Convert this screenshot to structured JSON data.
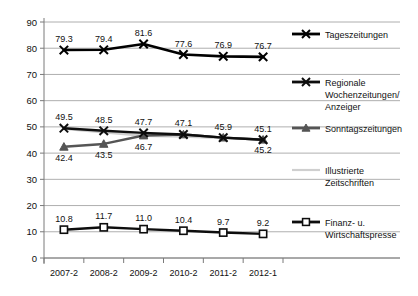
{
  "chart_data": {
    "type": "line",
    "title": "",
    "subtitle": "",
    "xlabel": "",
    "ylabel": "",
    "ylim": [
      0,
      90
    ],
    "ytick_step": 10,
    "yticks": [
      "0",
      "10",
      "20",
      "30",
      "40",
      "50",
      "60",
      "70",
      "80",
      "90"
    ],
    "grid": true,
    "legend_position": "right",
    "categories": [
      "2007-2",
      "2008-2",
      "2009-2",
      "2010-2",
      "2011-2",
      "2012-1"
    ],
    "series": [
      {
        "name": "Tageszeitungen",
        "color": "#000000",
        "marker": "x",
        "values": [
          79.3,
          79.4,
          81.6,
          77.6,
          76.9,
          76.7
        ],
        "labels": [
          "79.3",
          "79.4",
          "81.6",
          "77.6",
          "76.9",
          "76.7"
        ],
        "label_position": "above"
      },
      {
        "name": "Regionale Wochenzeitungen/ Anzeiger",
        "color": "#0d0d0d",
        "marker": "x",
        "values": [
          49.5,
          48.5,
          47.7,
          47.1,
          45.9,
          45.1
        ],
        "labels": [
          "49.5",
          "48.5",
          "47.7",
          "47.1",
          "45.9",
          "45.1"
        ],
        "label_position": "above"
      },
      {
        "name": "Sonntagszeitungen",
        "color": "#555555",
        "marker": "triangle",
        "values": [
          42.4,
          43.5,
          46.7,
          47.1,
          45.9,
          45.1
        ],
        "labels": [
          "42.4",
          "43.5",
          "46.7",
          "",
          "",
          ""
        ],
        "label_position": "below"
      },
      {
        "name": "Illustrierte Zeitschriften",
        "color": "#cfcfcf",
        "marker": "none",
        "values": [
          49.3,
          48.0,
          46.6,
          46.4,
          45.8,
          45.2
        ],
        "labels": [
          "",
          "",
          "",
          "",
          "",
          "45.2"
        ],
        "label_position": "below"
      },
      {
        "name": "Finanz- u. Wirtschaftspresse",
        "color": "#0d0d0d",
        "marker": "square",
        "values": [
          10.8,
          11.7,
          11.0,
          10.4,
          9.7,
          9.2
        ],
        "labels": [
          "10.8",
          "11.7",
          "11.0",
          "10.4",
          "9.7",
          "9.2"
        ],
        "label_position": "above"
      }
    ],
    "legend": [
      {
        "label": "Tageszeitungen",
        "lines": [
          "Tageszeitungen"
        ],
        "color": "#000000",
        "marker": "x"
      },
      {
        "label": "Regionale Wochenzeitungen/ Anzeiger",
        "lines": [
          "Regionale",
          "Wochenzeitungen/",
          "Anzeiger"
        ],
        "color": "#0d0d0d",
        "marker": "x"
      },
      {
        "label": "Sonntagszeitungen",
        "lines": [
          "Sonntagszeitungen"
        ],
        "color": "#555555",
        "marker": "triangle"
      },
      {
        "label": "Illustrierte Zeitschriften",
        "lines": [
          "Illustrierte",
          "Zeitschriften"
        ],
        "color": "#cfcfcf",
        "marker": "none"
      },
      {
        "label": "Finanz- u. Wirtschaftspresse",
        "lines": [
          "Finanz- u.",
          "Wirtschaftspresse"
        ],
        "color": "#0d0d0d",
        "marker": "square"
      }
    ]
  }
}
